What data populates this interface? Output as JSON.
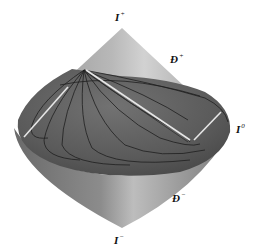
{
  "diagram": {
    "type": "penrose-diagram-3d",
    "labels": {
      "future_timelike_infinity": {
        "base": "I",
        "sup": "+"
      },
      "future_null_infinity": {
        "base": "Đ",
        "sup": "+"
      },
      "spatial_infinity": {
        "base": "I",
        "sup": "0"
      },
      "past_null_infinity": {
        "base": "Đ",
        "sup": "−"
      },
      "past_timelike_infinity": {
        "base": "I",
        "sup": "−"
      }
    },
    "colors": {
      "background": "#ffffff",
      "upper_cone_light": "#c4c4c4",
      "upper_cone_dark": "#8a8a8a",
      "lower_cone_light": "#b0b0b0",
      "lower_cone_dark": "#6e6e6e",
      "disk_surface": "#5e5e5e",
      "curves": "#1e1e1e",
      "highlight": "#e8e8e8"
    }
  }
}
